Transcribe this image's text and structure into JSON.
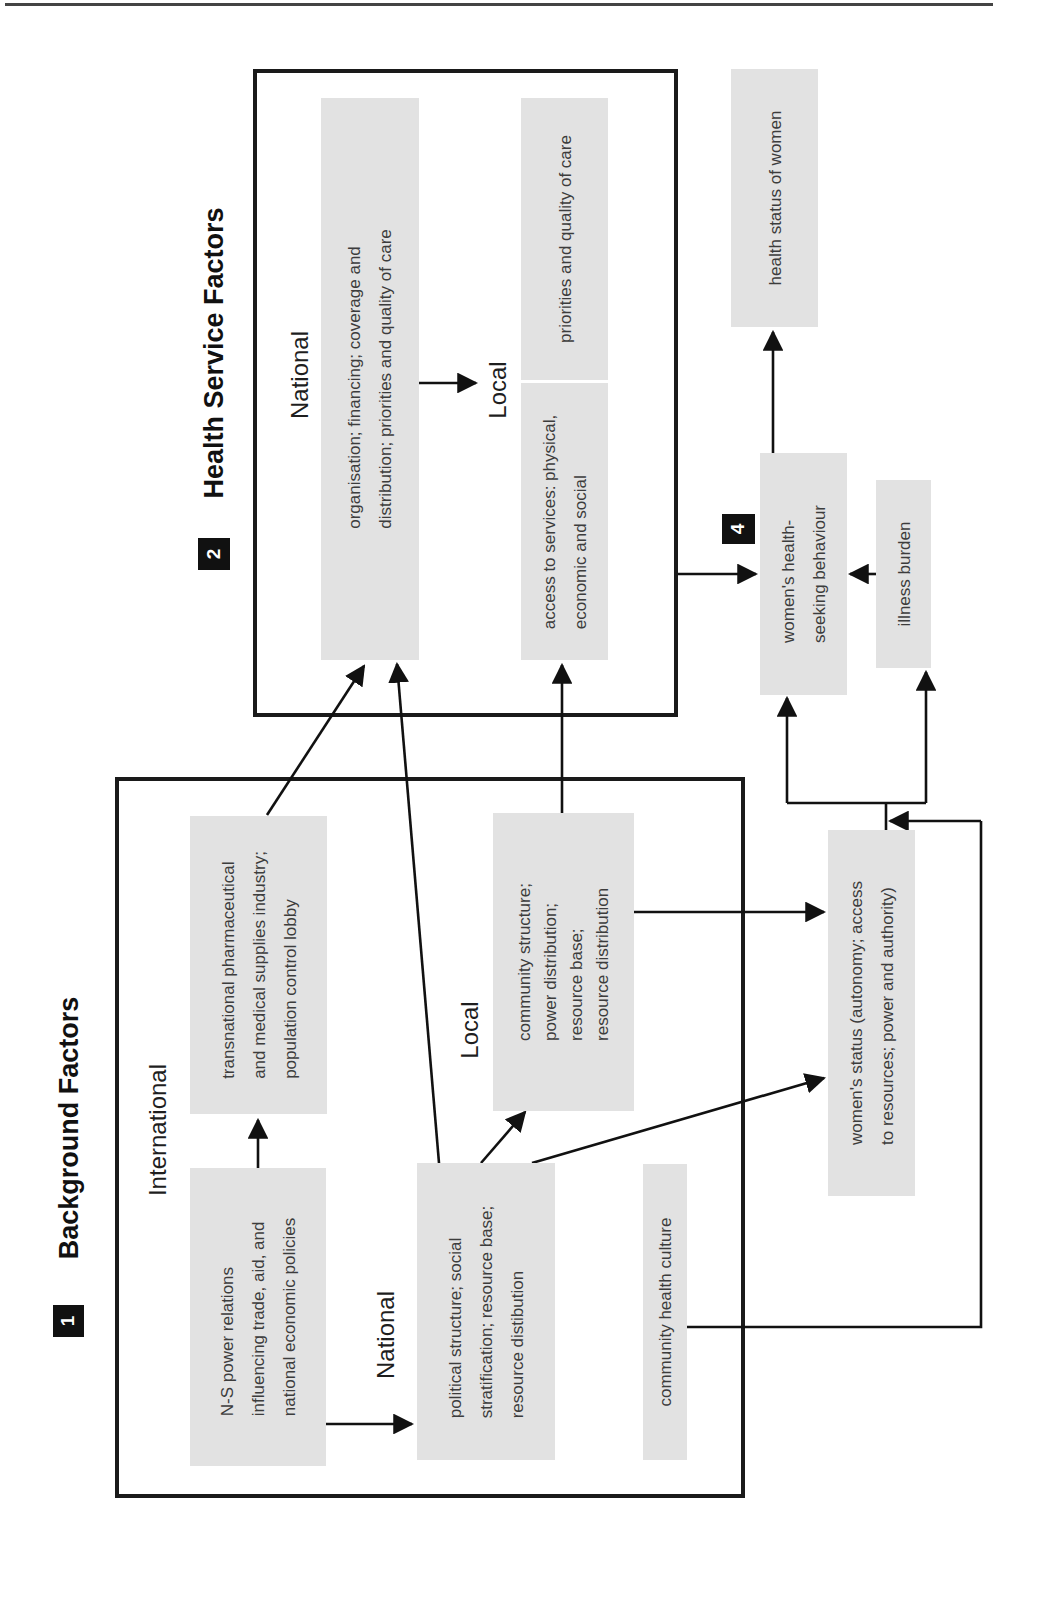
{
  "sections": {
    "background": {
      "number": "1",
      "title": "Background Factors",
      "levels": {
        "international": "International",
        "national": "National",
        "local": "Local"
      },
      "boxes": {
        "ns_power": [
          "N-S power relations",
          "influencing trade, aid, and",
          "national economic policies"
        ],
        "transnational": [
          "transnational pharmaceutical",
          "and medical supplies industry;",
          "population control lobby"
        ],
        "political": [
          "political structure; social",
          "stratification; resource base;",
          "resource distibution"
        ],
        "community_structure": [
          "community structure;",
          "power distribution;",
          "resource base;",
          "resource distribution"
        ],
        "community_health_culture": [
          "community health culture"
        ]
      }
    },
    "health_service": {
      "number": "2",
      "title": "Health Service Factors",
      "levels": {
        "national": "National",
        "local": "Local"
      },
      "boxes": {
        "national_org": [
          "organisation; financing; coverage and",
          "distribution; priorities and quality of care"
        ],
        "local_priorities": [
          "priorities and quality of care"
        ],
        "local_access": [
          "access to services: physical,",
          "economic and social"
        ]
      }
    },
    "womens_status": {
      "number": "3",
      "box": [
        "women's status (autonomy; access",
        "to resources; power and authority)"
      ]
    },
    "health_seeking": {
      "number": "4",
      "box": [
        "women's health-",
        "seeking behaviour"
      ]
    },
    "outcomes": {
      "health_status": [
        "health status of women"
      ],
      "illness_burden": [
        "illness burden"
      ]
    }
  },
  "colors": {
    "box_fill": "#e2e2e2",
    "frame": "#1a1a1a",
    "badge": "#111111",
    "arrow": "#111111"
  }
}
